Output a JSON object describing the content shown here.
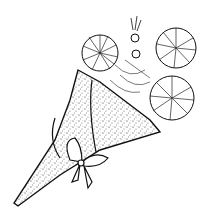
{
  "image": {
    "subject": "bouquet of chrysanthemum-like flowers wrapped in a speckled paper cone tied with a bow",
    "style": "black and white ink line art",
    "colors": {
      "background": "#ffffff",
      "ink": "#111111",
      "speckle": "#444444"
    }
  }
}
